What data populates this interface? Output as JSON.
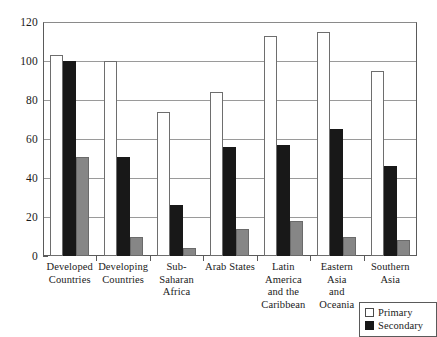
{
  "chart_data": {
    "type": "bar",
    "title": "",
    "subtitle": "",
    "xlabel": "",
    "ylabel": "",
    "ylim": [
      0,
      120
    ],
    "yticks": [
      0,
      20,
      40,
      60,
      80,
      100,
      120
    ],
    "grid": true,
    "legend_position": "bottom-right",
    "categories": [
      "Developed Countries",
      "Developing Countries",
      "Sub-Saharan Africa",
      "Arab States",
      "Latin America and the Caribbean",
      "Eastern Asia and Oceania",
      "Southern Asia"
    ],
    "category_lines": [
      [
        "Developed",
        "Countries"
      ],
      [
        "Developing",
        "Countries"
      ],
      [
        "Sub-Saharan",
        "Africa"
      ],
      [
        "Arab States"
      ],
      [
        "Latin America",
        "and the",
        "Caribbean"
      ],
      [
        "Eastern Asia",
        "and Oceania"
      ],
      [
        "Southern Asia"
      ]
    ],
    "series": [
      {
        "name": "Primary",
        "color": "#ffffff",
        "values": [
          103,
          100,
          74,
          84,
          113,
          115,
          95
        ]
      },
      {
        "name": "Secondary",
        "color": "#181818",
        "values": [
          100,
          51,
          26,
          56,
          57,
          65,
          46
        ]
      },
      {
        "name": "Tertiary",
        "color": "#868686",
        "values": [
          51,
          10,
          4,
          14,
          18,
          10,
          8
        ]
      }
    ]
  },
  "legend": {
    "entries": [
      {
        "label": "Primary",
        "swatch": "primary"
      },
      {
        "label": "Secondary",
        "swatch": "secondary"
      }
    ]
  },
  "yaxis": {
    "labels": [
      "120",
      "100",
      "80",
      "60",
      "40",
      "20",
      "0"
    ]
  }
}
